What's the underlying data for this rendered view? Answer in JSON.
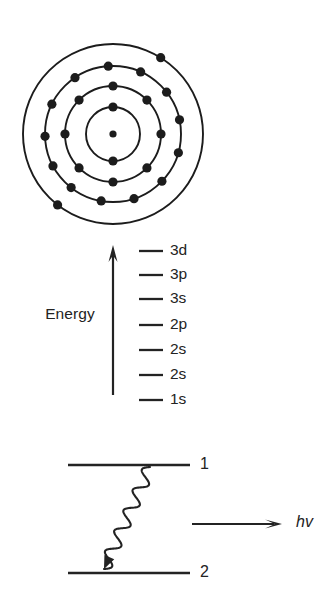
{
  "figure": {
    "background_color": "#ffffff",
    "ink_color": "#232323",
    "panels": [
      {
        "id": "bohr-atom",
        "name": "Bohr atomic shell model"
      },
      {
        "id": "energy-levels",
        "name": "Orbital energy level diagram"
      },
      {
        "id": "photon-emission",
        "name": "Electron transition photon emission"
      }
    ]
  },
  "atom": {
    "center_x": 113,
    "center_y": 134,
    "nucleus_radius": 3.6,
    "ring_stroke_width": 1.9,
    "electron_radius": 4.6,
    "shells": [
      {
        "index": 1,
        "radius": 27,
        "electron_count": 2,
        "angles_deg": [
          -90,
          90
        ]
      },
      {
        "index": 2,
        "radius": 48,
        "electron_count": 8,
        "angles_deg": [
          -90,
          -45,
          0,
          45,
          90,
          135,
          180,
          225
        ]
      },
      {
        "index": 3,
        "radius": 68,
        "electron_count": 13,
        "angles_deg": [
          -94,
          -66,
          -38,
          -12,
          16,
          44,
          72,
          100,
          128,
          152,
          178,
          206,
          236
        ]
      },
      {
        "index": 4,
        "radius": 90,
        "electron_count": 2,
        "angles_deg": [
          -58,
          128
        ]
      }
    ]
  },
  "energy_diagram": {
    "axis_label": "Energy",
    "axis_label_x": 70,
    "axis_label_y": 315,
    "arrow": {
      "x": 113,
      "y_top": 245,
      "y_bottom": 395,
      "shaft_width": 2.2,
      "head_width": 9,
      "head_height": 17
    },
    "tick": {
      "x_start": 139,
      "x_end": 163,
      "stroke_width": 2.3
    },
    "label_x": 170,
    "levels": [
      {
        "label": "3d",
        "y": 251
      },
      {
        "label": "3p",
        "y": 275
      },
      {
        "label": "3s",
        "y": 299
      },
      {
        "label": "2p",
        "y": 325
      },
      {
        "label": "2s",
        "y": 350
      },
      {
        "label": "2s",
        "y": 375
      },
      {
        "label": "1s",
        "y": 400
      }
    ]
  },
  "emission_diagram": {
    "states": [
      {
        "label": "1",
        "y": 465,
        "x_start": 68,
        "x_end": 190,
        "label_x": 200
      },
      {
        "label": "2",
        "y": 573,
        "x_start": 68,
        "x_end": 190,
        "label_x": 200
      }
    ],
    "state_line_width": 2.4,
    "transition": {
      "type": "wavy-arrow",
      "direction": "downward",
      "x_start": 150,
      "y_start": 467,
      "x_end": 104,
      "y_end": 569,
      "oscillations": 5
    },
    "photon_arrow": {
      "x_start": 192,
      "x_end": 282,
      "y": 524,
      "shaft_width": 2.2,
      "head_length": 17,
      "head_width": 9
    },
    "photon_label": "hv",
    "photon_label_x": 296,
    "photon_label_y": 523
  }
}
